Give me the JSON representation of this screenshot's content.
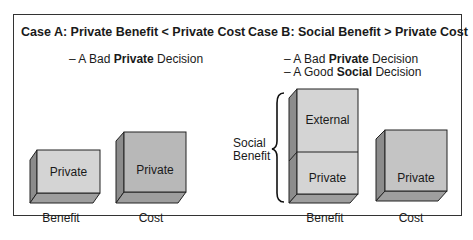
{
  "case_a": {
    "title": "Case A: Private Benefit < Private Cost",
    "lines": [
      {
        "prefix": "– A Bad ",
        "bold": "Private",
        "suffix": " Decision"
      }
    ],
    "benefit_box_label": "Private",
    "cost_box_label": "Private",
    "benefit_axis_label": "Benefit",
    "cost_axis_label": "Cost"
  },
  "case_b": {
    "title": "Case B: Social Benefit > Private Cost",
    "lines": [
      {
        "prefix": "– A Bad ",
        "bold": "Private",
        "suffix": " Decision"
      },
      {
        "prefix": "– A Good ",
        "bold": "Social",
        "suffix": " Decision"
      }
    ],
    "brace_label_1": "Social",
    "brace_label_2": "Benefit",
    "external_box_label": "External",
    "benefit_box_label": "Private",
    "cost_box_label": "Private",
    "benefit_axis_label": "Benefit",
    "cost_axis_label": "Cost"
  },
  "colors": {
    "light_face": "#d4d4d4",
    "dark_face": "#b0b0b0",
    "side": "#8c8c8c",
    "bottom": "#9e9e9e"
  }
}
